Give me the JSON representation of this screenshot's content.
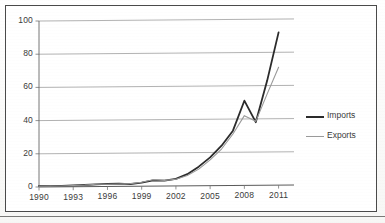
{
  "chart_data": {
    "type": "line",
    "title": "",
    "subtitle": "",
    "xlabel": "",
    "ylabel": "",
    "xlim": [
      1990,
      2012
    ],
    "ylim": [
      0,
      100
    ],
    "grid": "horizontal",
    "legend_position": "right",
    "x": [
      1990,
      1991,
      1992,
      1993,
      1994,
      1995,
      1996,
      1997,
      1998,
      1999,
      2000,
      2001,
      2002,
      2003,
      2004,
      2005,
      2006,
      2007,
      2008,
      2009,
      2010,
      2011
    ],
    "x_ticks": [
      "1990",
      "1993",
      "1996",
      "1999",
      "2002",
      "2005",
      "2008",
      "2011"
    ],
    "y_ticks": [
      "0",
      "20",
      "40",
      "60",
      "80",
      "100"
    ],
    "series": [
      {
        "name": "Imports",
        "color": "#2b2b2b",
        "width": 1.8,
        "values": [
          0.6,
          0.5,
          0.6,
          0.8,
          1.0,
          1.3,
          1.5,
          1.6,
          1.3,
          2.2,
          3.5,
          3.2,
          4.2,
          7.0,
          11.5,
          17.0,
          24.0,
          33.0,
          51.0,
          38.0,
          63.0,
          92.0
        ]
      },
      {
        "name": "Exports",
        "color": "#9a9a9a",
        "width": 1.1,
        "values": [
          0.5,
          0.4,
          0.5,
          0.7,
          0.9,
          1.4,
          1.3,
          1.4,
          1.6,
          2.4,
          3.8,
          3.4,
          4.0,
          6.2,
          10.0,
          15.5,
          22.0,
          31.0,
          42.0,
          38.5,
          55.0,
          71.0
        ]
      }
    ]
  },
  "legend": {
    "items": [
      {
        "label": "Imports",
        "color": "#2b2b2b"
      },
      {
        "label": "Exports",
        "color": "#9a9a9a"
      }
    ]
  }
}
